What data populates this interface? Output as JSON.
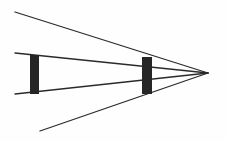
{
  "diagram": {
    "type": "converging-rays-with-two-bars",
    "width": 226,
    "height": 141,
    "background": "#fefefe",
    "line_color": "#2a2a2a",
    "bar_color": "#262626",
    "apex": {
      "x": 208,
      "y": 73
    },
    "rays": [
      {
        "id": "top-ray",
        "x1": 15,
        "y1": 12,
        "x2": 208,
        "y2": 73
      },
      {
        "id": "upper-inner-ray",
        "x1": 15,
        "y1": 53,
        "x2": 208,
        "y2": 73
      },
      {
        "id": "lower-inner-ray",
        "x1": 15,
        "y1": 94,
        "x2": 208,
        "y2": 73
      },
      {
        "id": "bottom-ray",
        "x1": 40,
        "y1": 131,
        "x2": 208,
        "y2": 73
      }
    ],
    "bars": [
      {
        "id": "left-bar",
        "x": 30,
        "y": 55,
        "width": 9,
        "height": 39
      },
      {
        "id": "right-bar",
        "x": 142,
        "y": 57,
        "width": 10,
        "height": 37
      }
    ]
  }
}
